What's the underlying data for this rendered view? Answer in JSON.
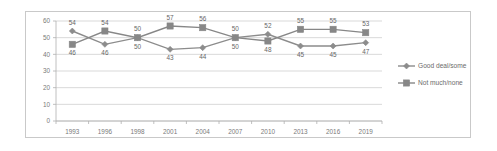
{
  "chart_data": {
    "type": "line",
    "title": "",
    "xlabel": "",
    "ylabel": "",
    "ylim": [
      0,
      60
    ],
    "yticks": [
      0,
      10,
      20,
      30,
      40,
      50,
      60
    ],
    "grid": true,
    "legend_position": "right",
    "categories": [
      "1993",
      "1996",
      "1998",
      "2001",
      "2004",
      "2007",
      "2010",
      "2013",
      "2016",
      "2019"
    ],
    "series": [
      {
        "name": "Good deal/some",
        "marker": "circle",
        "color": "#8c8c8c",
        "values": [
          54,
          46,
          50,
          43,
          44,
          50,
          52,
          45,
          45,
          47
        ]
      },
      {
        "name": "Not much/none",
        "marker": "square",
        "color": "#878787",
        "values": [
          46,
          54,
          50,
          57,
          56,
          50,
          48,
          55,
          55,
          53
        ]
      }
    ]
  },
  "axis": {
    "y_tick_labels": [
      "60",
      "50",
      "40",
      "30",
      "20",
      "10",
      "0"
    ],
    "x_tick_labels": [
      "1993",
      "1996",
      "1998",
      "2001",
      "2004",
      "2007",
      "2010",
      "2013",
      "2016",
      "2019"
    ]
  },
  "legend": {
    "items": [
      {
        "label": "Good deal/some",
        "marker": "circle-marker",
        "color": "#8c8c8c"
      },
      {
        "label": "Not much/none",
        "marker": "square-marker",
        "color": "#878787"
      }
    ]
  },
  "data_labels": {
    "good_deal_some": [
      "54",
      "46",
      "50",
      "43",
      "44",
      "50",
      "52",
      "45",
      "45",
      "47"
    ],
    "not_much_none": [
      "46",
      "54",
      "50",
      "57",
      "56",
      "50",
      "48",
      "55",
      "55",
      "53"
    ]
  }
}
